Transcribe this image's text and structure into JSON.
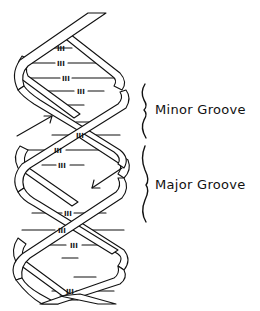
{
  "figure": {
    "labels": {
      "minor_groove": "Minor Groove",
      "major_groove": "Major Groove"
    },
    "base_pair_marker": "III",
    "base_pair_count": 16,
    "strand_direction_arrows": [
      {
        "name": "upward-strand-arrow",
        "direction": "up-right"
      },
      {
        "name": "downward-strand-arrow",
        "direction": "down-left"
      }
    ],
    "colors": {
      "line": "#111111",
      "background": "#ffffff"
    }
  }
}
